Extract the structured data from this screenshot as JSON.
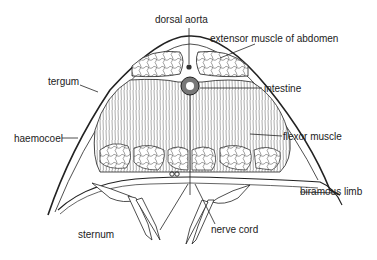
{
  "diagram": {
    "labels": {
      "dorsal_aorta": "dorsal aorta",
      "extensor_muscle": "extensor muscle of abdomen",
      "intestine": "intestine",
      "tergum": "tergum",
      "haemocoel": "haemocoel",
      "flexor_muscle": "flexor muscle",
      "biramous_limb": "biramous limb",
      "sternum": "sternum",
      "nerve_cord": "nerve cord"
    },
    "colors": {
      "ink": "#222222",
      "background": "#ffffff",
      "muscle_shade": "#e8e8e8"
    }
  }
}
